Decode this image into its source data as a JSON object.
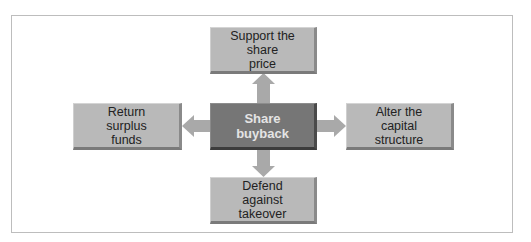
{
  "diagram": {
    "center": {
      "label": "Share buyback",
      "line1": "Share",
      "line2": "buyback"
    },
    "nodes": {
      "top": {
        "line1": "Support the share",
        "line2": "price"
      },
      "left": {
        "line1": "Return surplus",
        "line2": "funds"
      },
      "right": {
        "line1": "Alter the capital",
        "line2": "structure"
      },
      "bottom": {
        "line1": "Defend against",
        "line2": "takeover"
      }
    },
    "colors": {
      "box_fill": "#b9b9b9",
      "center_fill": "#767676",
      "arrow_fill": "#a9a9a9",
      "frame_border": "#bdbdbd"
    }
  }
}
